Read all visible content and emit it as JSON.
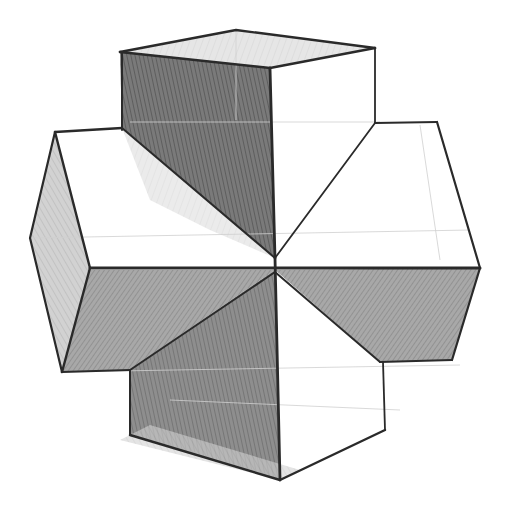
{
  "artwork": {
    "subject": "pencil sketch of a geometric cross-shaped solid (intersecting rectangular prisms)",
    "medium": "graphite pencil on white paper",
    "colors": {
      "paper": "#ffffff",
      "line": "#2a2a2a",
      "dark_shade": "#6d6d6d",
      "mid_shade": "#9a9a9a",
      "light_shade": "#c9c9c9"
    }
  }
}
